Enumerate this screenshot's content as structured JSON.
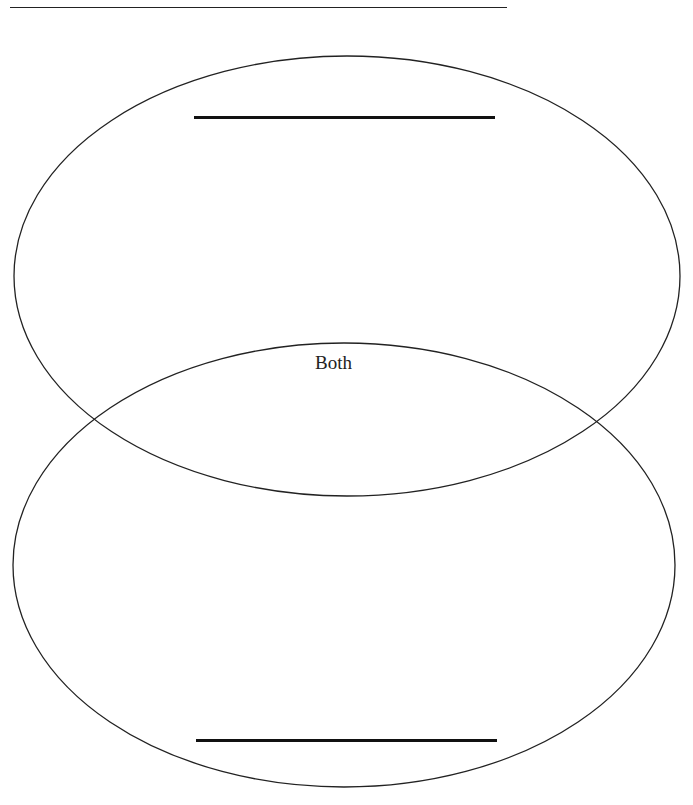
{
  "diagram": {
    "type": "venn",
    "orientation": "vertical",
    "circles": [
      {
        "name": "top",
        "title_blank": ""
      },
      {
        "name": "bottom",
        "title_blank": ""
      }
    ],
    "overlap_label": "Both",
    "stroke_color": "#222222",
    "background": "#ffffff"
  }
}
